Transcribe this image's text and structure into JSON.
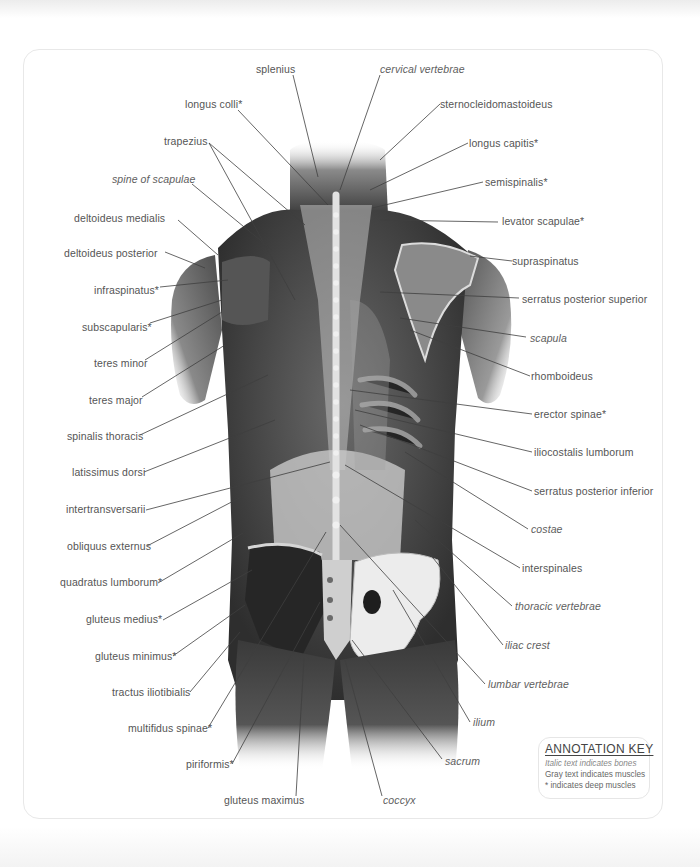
{
  "diagram": {
    "colors": {
      "label_text": "#555555",
      "leader_line": "#444444",
      "frame_border": "#e8e8e8",
      "illustration_dark": "#2b2b2b",
      "illustration_light": "#d9d9d9"
    },
    "labels_left": [
      {
        "text": "splenius",
        "type": "muscle",
        "deep": false
      },
      {
        "text": "longus colli*",
        "type": "muscle",
        "deep": true
      },
      {
        "text": "trapezius",
        "type": "muscle",
        "deep": false
      },
      {
        "text": "spine of scapulae",
        "type": "bone",
        "deep": false
      },
      {
        "text": "deltoideus medialis",
        "type": "muscle",
        "deep": false
      },
      {
        "text": "deltoideus posterior",
        "type": "muscle",
        "deep": false
      },
      {
        "text": "infraspinatus*",
        "type": "muscle",
        "deep": true
      },
      {
        "text": "subscapularis*",
        "type": "muscle",
        "deep": true
      },
      {
        "text": "teres minor",
        "type": "muscle",
        "deep": false
      },
      {
        "text": "teres major",
        "type": "muscle",
        "deep": false
      },
      {
        "text": "spinalis thoracis",
        "type": "muscle",
        "deep": false
      },
      {
        "text": "latissimus dorsi",
        "type": "muscle",
        "deep": false
      },
      {
        "text": "intertransversarii",
        "type": "muscle",
        "deep": false
      },
      {
        "text": "obliquus externus",
        "type": "muscle",
        "deep": false
      },
      {
        "text": "quadratus lumborum*",
        "type": "muscle",
        "deep": true
      },
      {
        "text": "gluteus medius*",
        "type": "muscle",
        "deep": true
      },
      {
        "text": "gluteus minimus*",
        "type": "muscle",
        "deep": true
      },
      {
        "text": "tractus iliotibialis",
        "type": "muscle",
        "deep": false
      },
      {
        "text": "multifidus spinae*",
        "type": "muscle",
        "deep": true
      },
      {
        "text": "piriformis*",
        "type": "muscle",
        "deep": true
      },
      {
        "text": "gluteus maximus",
        "type": "muscle",
        "deep": false
      }
    ],
    "labels_right": [
      {
        "text": "cervical vertebrae",
        "type": "bone",
        "deep": false
      },
      {
        "text": "sternocleidomastoideus",
        "type": "muscle",
        "deep": false
      },
      {
        "text": "longus capitis*",
        "type": "muscle",
        "deep": true
      },
      {
        "text": "semispinalis*",
        "type": "muscle",
        "deep": true
      },
      {
        "text": "levator scapulae*",
        "type": "muscle",
        "deep": true
      },
      {
        "text": "supraspinatus",
        "type": "muscle",
        "deep": false
      },
      {
        "text": "serratus posterior superior",
        "type": "muscle",
        "deep": false
      },
      {
        "text": "scapula",
        "type": "bone",
        "deep": false
      },
      {
        "text": "rhomboideus",
        "type": "muscle",
        "deep": false
      },
      {
        "text": "erector spinae*",
        "type": "muscle",
        "deep": true
      },
      {
        "text": "iliocostalis lumborum",
        "type": "muscle",
        "deep": false
      },
      {
        "text": "serratus posterior inferior",
        "type": "muscle",
        "deep": false
      },
      {
        "text": "costae",
        "type": "bone",
        "deep": false
      },
      {
        "text": "interspinales",
        "type": "muscle",
        "deep": false
      },
      {
        "text": "thoracic vertebrae",
        "type": "bone",
        "deep": false
      },
      {
        "text": "iliac crest",
        "type": "bone",
        "deep": false
      },
      {
        "text": "lumbar vertebrae",
        "type": "bone",
        "deep": false
      },
      {
        "text": "ilium",
        "type": "bone",
        "deep": false
      },
      {
        "text": "sacrum",
        "type": "bone",
        "deep": false
      },
      {
        "text": "coccyx",
        "type": "bone",
        "deep": false
      }
    ],
    "annotation_key": {
      "title": "ANNOTATION KEY",
      "lines": [
        "Italic text indicates bones",
        "Gray text indicates muscles",
        "* indicates deep muscles"
      ]
    }
  }
}
